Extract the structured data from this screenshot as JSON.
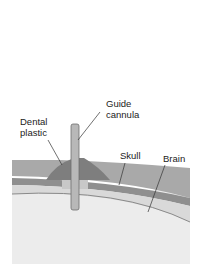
{
  "diagram": {
    "labels": {
      "guide_cannula_line1": "Guide",
      "guide_cannula_line2": "cannula",
      "dental_plastic_line1": "Dental",
      "dental_plastic_line2": "plastic",
      "skull": "Skull",
      "brain": "Brain"
    },
    "colors": {
      "background": "#ffffff",
      "scalp": "#a9a9a9",
      "skull": "#8f8f8f",
      "dental_plastic": "#7e7e7e",
      "brain": "#ececec",
      "meninges": "#d9d9d9",
      "cannula": "#b8b8b8",
      "cannula_edge": "#6e6e6e",
      "leader_line": "#333333"
    }
  }
}
